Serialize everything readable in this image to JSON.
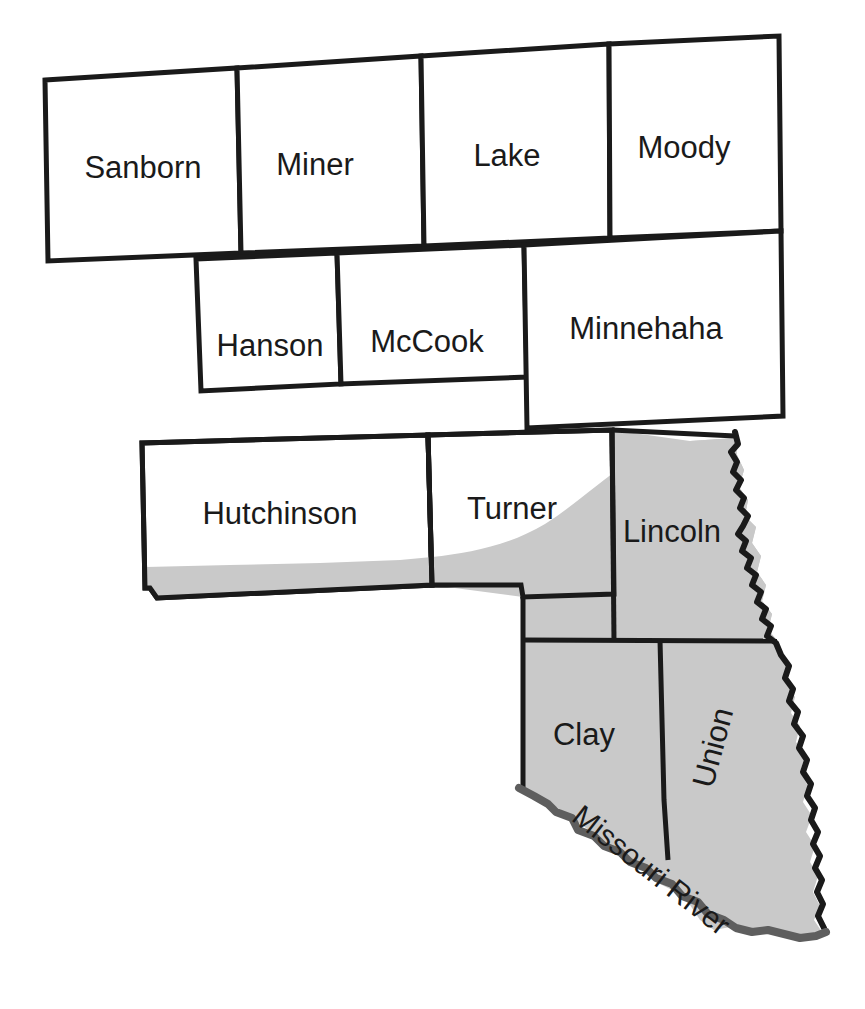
{
  "map": {
    "title": "Southeastern South Dakota Counties",
    "background_color": "#ffffff",
    "border_color": "#1a1a1a",
    "shaded_region_color": "#c9c9c9",
    "river_color": "#5e5e5e",
    "counties": [
      {
        "id": "sanborn",
        "label": "Sanborn",
        "shaded": false,
        "label_x": 143,
        "label_y": 170,
        "rotation": 0
      },
      {
        "id": "miner",
        "label": "Miner",
        "shaded": false,
        "label_x": 315,
        "label_y": 167,
        "rotation": 0
      },
      {
        "id": "lake",
        "label": "Lake",
        "shaded": false,
        "label_x": 507,
        "label_y": 158,
        "rotation": 0
      },
      {
        "id": "moody",
        "label": "Moody",
        "shaded": false,
        "label_x": 684,
        "label_y": 150,
        "rotation": 0
      },
      {
        "id": "hanson",
        "label": "Hanson",
        "shaded": false,
        "label_x": 270,
        "label_y": 348,
        "rotation": 0
      },
      {
        "id": "mccook",
        "label": "McCook",
        "shaded": false,
        "label_x": 427,
        "label_y": 344,
        "rotation": 0
      },
      {
        "id": "minnehaha",
        "label": "Minnehaha",
        "shaded": false,
        "label_x": 646,
        "label_y": 331,
        "rotation": 0
      },
      {
        "id": "hutchinson",
        "label": "Hutchinson",
        "shaded": false,
        "label_x": 280,
        "label_y": 516,
        "rotation": 0
      },
      {
        "id": "turner",
        "label": "Turner",
        "shaded": false,
        "label_x": 512,
        "label_y": 511,
        "rotation": 0
      },
      {
        "id": "lincoln",
        "label": "Lincoln",
        "shaded": true,
        "label_x": 672,
        "label_y": 534,
        "rotation": 0
      },
      {
        "id": "clay",
        "label": "Clay",
        "shaded": true,
        "label_x": 584,
        "label_y": 737,
        "rotation": 0
      },
      {
        "id": "union",
        "label": "Union",
        "shaded": true,
        "label_x": 715,
        "label_y": 748,
        "rotation": -75
      }
    ],
    "features": [
      {
        "id": "missouri-river",
        "label": "Missouri River",
        "label_x": 650,
        "label_y": 872,
        "rotation": 38
      }
    ]
  }
}
